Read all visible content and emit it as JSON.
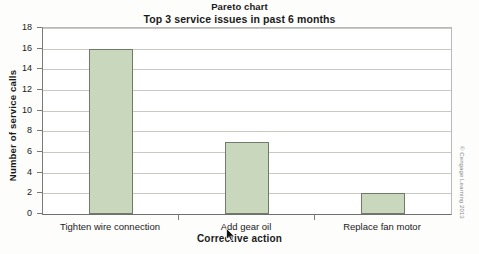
{
  "chart_data": {
    "type": "bar",
    "title": "Pareto chart",
    "subtitle": "Top 3 service issues in past 6 months",
    "xlabel": "Corrective action",
    "ylabel": "Number of service calls",
    "categories": [
      "Tighten wire connection",
      "Add gear oil",
      "Replace fan motor"
    ],
    "values": [
      16,
      7,
      2
    ],
    "ylim": [
      0,
      18
    ],
    "ytick_step": 2,
    "yticks": [
      0,
      2,
      4,
      6,
      8,
      10,
      12,
      14,
      16,
      18
    ],
    "ytick_labels": [
      "0",
      "2",
      "4",
      "6",
      "8",
      "10",
      "12",
      "14",
      "16",
      "18"
    ],
    "grid": "horizontal",
    "legend": "none",
    "bar_fill_color": "#c9d8bd",
    "bar_border_color": "#6f7a68",
    "gridline_color": "#c9c9c4",
    "axis_color": "#7a7a7a",
    "plot_background": "#ffffff"
  },
  "credit": {
    "text": "© Cengage Learning 2013"
  },
  "cursor": {
    "name": "mouse-pointer"
  }
}
